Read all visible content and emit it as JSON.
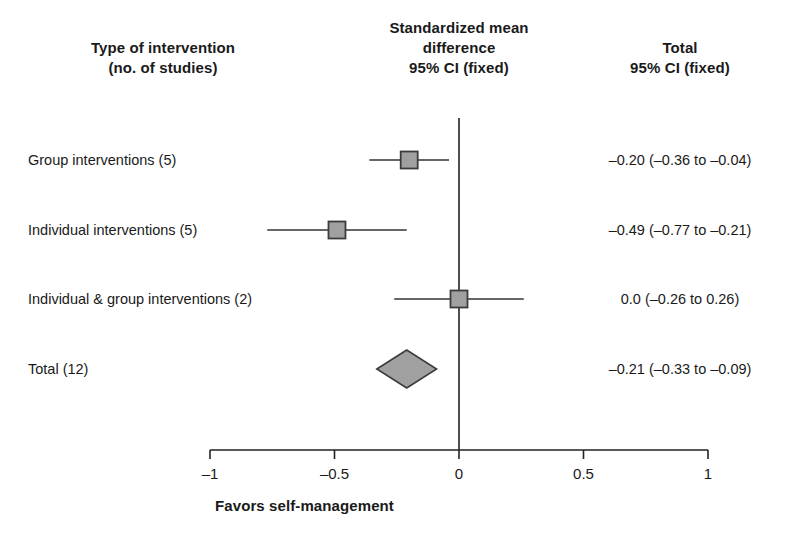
{
  "headers": {
    "left": "Type of intervention\n(no. of studies)",
    "middle": "Standardized mean\ndifference\n95% CI (fixed)",
    "right": "Total\n95% CI (fixed)"
  },
  "chart_data": {
    "type": "forest",
    "title": "Standardized mean difference 95% CI (fixed)",
    "xlabel": "Favors self-management",
    "ylabel": "",
    "xlim": [
      -1,
      1
    ],
    "xticks": [
      -1,
      -0.5,
      0,
      0.5,
      1
    ],
    "xticklabels": [
      "–1",
      "–0.5",
      "0",
      "0.5",
      "1"
    ],
    "grid": false,
    "null_line": 0,
    "legend": "none",
    "columns": [
      "Type of intervention (no. of studies)",
      "Standardized mean difference 95% CI (fixed)",
      "Total 95% CI (fixed)"
    ],
    "rows": [
      {
        "label": "Group interventions (5)",
        "studies": 5,
        "estimate": -0.2,
        "ci_low": -0.36,
        "ci_high": -0.04,
        "total_text": "–0.20 (–0.36 to –0.04)",
        "marker": "square"
      },
      {
        "label": "Individual interventions (5)",
        "studies": 5,
        "estimate": -0.49,
        "ci_low": -0.77,
        "ci_high": -0.21,
        "total_text": "–0.49 (–0.77 to –0.21)",
        "marker": "square"
      },
      {
        "label": "Individual & group interventions (2)",
        "studies": 2,
        "estimate": 0.0,
        "ci_low": -0.26,
        "ci_high": 0.26,
        "total_text": "0.0 (–0.26 to 0.26)",
        "marker": "square"
      },
      {
        "label": "Total (12)",
        "studies": 12,
        "estimate": -0.21,
        "ci_low": -0.33,
        "ci_high": -0.09,
        "total_text": "–0.21 (–0.33 to –0.09)",
        "marker": "diamond"
      }
    ],
    "colors": {
      "marker_fill": "#a0a0a0",
      "marker_stroke": "#3c3c3c",
      "line": "#333333",
      "axis": "#222222",
      "text": "#1a1a1a"
    }
  },
  "geometry": {
    "x_left_px": 210,
    "x_right_px": 708,
    "x_zero_px": 459,
    "axis_y_px": 450,
    "null_line_top_px": 118,
    "row_y_px": [
      160,
      230,
      299,
      369
    ],
    "tick_len_px": 9,
    "square_size_px": 17,
    "diamond_half_height_px": 19
  }
}
